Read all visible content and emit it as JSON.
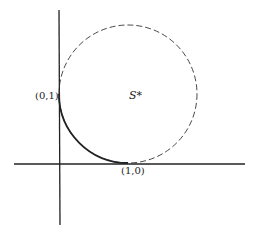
{
  "diagram": {
    "labels": {
      "point_a": "(0,1)",
      "point_b": "(1,0)",
      "region": "S*"
    },
    "colors": {
      "line": "#222222",
      "background": "#ffffff"
    }
  }
}
